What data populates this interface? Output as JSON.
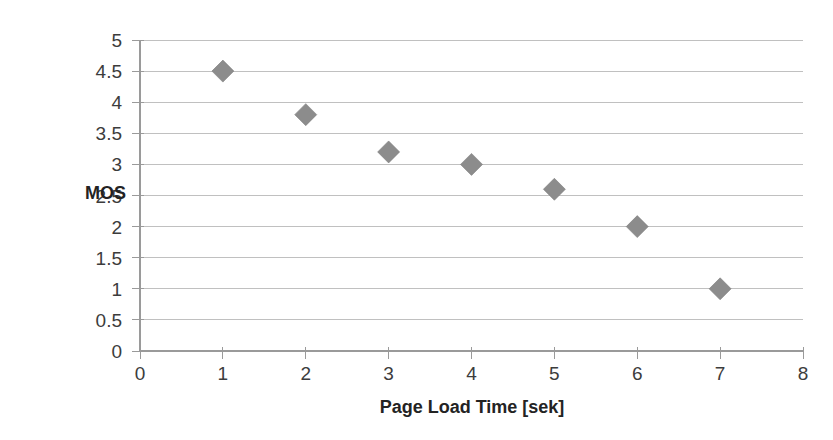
{
  "chart_data": {
    "type": "scatter",
    "title": "",
    "xlabel": "Page Load Time [sek]",
    "ylabel": "MOS",
    "x": [
      1,
      2,
      3,
      4,
      5,
      6,
      7
    ],
    "values": [
      4.5,
      3.8,
      3.2,
      3.0,
      2.6,
      2.0,
      1.0
    ],
    "series": [
      {
        "name": "MOS",
        "marker": "diamond",
        "color": "#8c8c8c",
        "points": [
          {
            "x": 1,
            "y": 4.5
          },
          {
            "x": 2,
            "y": 3.8
          },
          {
            "x": 3,
            "y": 3.2
          },
          {
            "x": 4,
            "y": 3.0
          },
          {
            "x": 5,
            "y": 2.6
          },
          {
            "x": 6,
            "y": 2.0
          },
          {
            "x": 7,
            "y": 1.0
          }
        ]
      }
    ],
    "xlim": [
      0,
      8
    ],
    "ylim": [
      0,
      5
    ],
    "xticks": [
      0,
      1,
      2,
      3,
      4,
      5,
      6,
      7,
      8
    ],
    "yticks": [
      0,
      0.5,
      1,
      1.5,
      2,
      2.5,
      3,
      3.5,
      4,
      4.5,
      5
    ],
    "xtick_labels": [
      "0",
      "1",
      "2",
      "3",
      "4",
      "5",
      "6",
      "7",
      "8"
    ],
    "ytick_labels": [
      "0",
      "0.5",
      "1",
      "1.5",
      "2",
      "2.5",
      "3",
      "3.5",
      "4",
      "4.5",
      "5"
    ],
    "grid": "horizontal",
    "legend": "none",
    "colors": {
      "marker": "#8c8c8c",
      "gridline": "#b9b9b9",
      "axis": "#9a9a9a",
      "text": "#3c3c3c",
      "background": "#ffffff"
    }
  }
}
